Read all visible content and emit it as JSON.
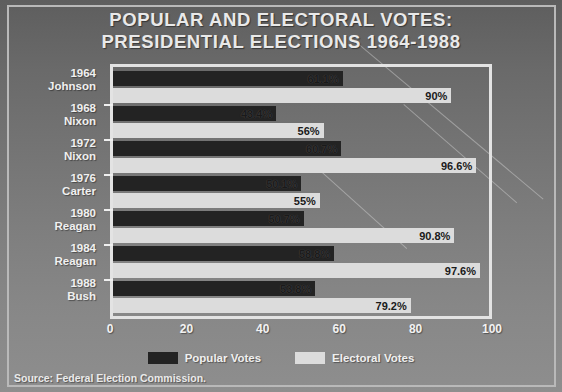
{
  "title": {
    "line1": "POPULAR AND ELECTORAL VOTES:",
    "line2": "PRESIDENTIAL ELECTIONS 1964-1988"
  },
  "source": "Source: Federal Election Commission.",
  "legend": {
    "popular": "Popular Votes",
    "electoral": "Electoral Votes"
  },
  "colors": {
    "popular": "#232323",
    "electoral": "#dcdcdc",
    "frame": "#e3e3e3",
    "text": "#f0f0f0"
  },
  "chart_data": {
    "type": "bar",
    "orientation": "horizontal",
    "title": "POPULAR AND ELECTORAL VOTES: PRESIDENTIAL ELECTIONS 1964-1988",
    "xlabel": "",
    "ylabel": "",
    "xlim": [
      0,
      100
    ],
    "xticks": [
      0,
      20,
      40,
      60,
      80,
      100
    ],
    "xtick_labels": [
      "0",
      "20",
      "40",
      "60",
      "80",
      "100"
    ],
    "grid": false,
    "legend_position": "bottom-center",
    "categories": [
      {
        "year": "1964",
        "name": "Johnson"
      },
      {
        "year": "1968",
        "name": "Nixon"
      },
      {
        "year": "1972",
        "name": "Nixon"
      },
      {
        "year": "1976",
        "name": "Carter"
      },
      {
        "year": "1980",
        "name": "Reagan"
      },
      {
        "year": "1984",
        "name": "Reagan"
      },
      {
        "year": "1988",
        "name": "Bush"
      }
    ],
    "series": [
      {
        "name": "Popular Votes",
        "color": "#232323",
        "values": [
          61.1,
          43.4,
          60.7,
          50.1,
          50.7,
          58.8,
          53.8
        ],
        "labels": [
          "61.1%",
          "43.4%",
          "60.7%",
          "50.1%",
          "50.7%",
          "58.8%",
          "53.8%"
        ]
      },
      {
        "name": "Electoral Votes",
        "color": "#dcdcdc",
        "values": [
          90,
          56,
          96.6,
          55,
          90.8,
          97.6,
          79.2
        ],
        "labels": [
          "90%",
          "56%",
          "96.6%",
          "55%",
          "90.8%",
          "97.6%",
          "79.2%"
        ]
      }
    ]
  }
}
